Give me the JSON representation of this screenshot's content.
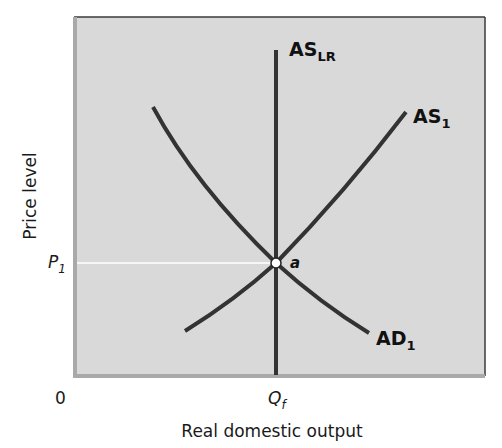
{
  "diagram": {
    "type": "AD-AS long-run equilibrium",
    "colors": {
      "plot_background": "#d9d9d9",
      "curve": "#333333",
      "guide_line": "#ffffff",
      "frame_dark": "#3a3a3a",
      "frame_light": "#a9a9a9"
    },
    "axes": {
      "x_label": "Real domestic output",
      "y_label": "Price level",
      "origin_label": "0",
      "x_tick": {
        "main": "Q",
        "sub": "f"
      },
      "y_tick": {
        "main": "P",
        "sub": "1"
      }
    },
    "curves": [
      {
        "id": "as_lr",
        "label_main": "AS",
        "label_sub": "LR",
        "shape": "vertical"
      },
      {
        "id": "as_1",
        "label_main": "AS",
        "label_sub": "1",
        "shape": "upward-sloping"
      },
      {
        "id": "ad_1",
        "label_main": "AD",
        "label_sub": "1",
        "shape": "downward-sloping"
      }
    ],
    "equilibrium_point": {
      "label": "a",
      "x": "Qf",
      "y": "P1"
    }
  }
}
